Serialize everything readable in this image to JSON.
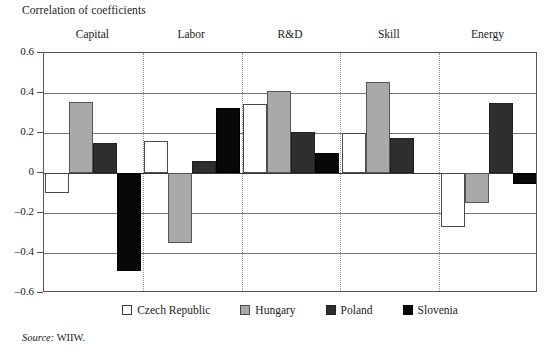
{
  "figure": {
    "title": "Correlation of coefficients",
    "source_prefix": "Source:",
    "source_value": "WIIW."
  },
  "axis": {
    "ytick_labels": [
      "0.6",
      "0.4",
      "0.2",
      "0",
      "–0.2",
      "–0.4",
      "–0.6"
    ]
  },
  "legend": {
    "items": [
      {
        "label": "Czech  Republic",
        "key": "czech",
        "color": "#ffffff"
      },
      {
        "label": "Hungary",
        "key": "hungary",
        "color": "#a9a9a9"
      },
      {
        "label": "Poland",
        "key": "poland",
        "color": "#2e2e2e"
      },
      {
        "label": "Slovenia",
        "key": "slovenia",
        "color": "#080808"
      }
    ]
  },
  "groups": {
    "labels": [
      "Capital",
      "Labor",
      "R&D",
      "Skill",
      "Energy"
    ]
  },
  "chart_data": {
    "type": "bar",
    "title": "Correlation of coefficients",
    "xlabel": "",
    "ylabel": "",
    "ylim": [
      -0.6,
      0.6
    ],
    "ytick_values": [
      0.6,
      0.4,
      0.2,
      0,
      -0.2,
      -0.4,
      -0.6
    ],
    "grid": true,
    "legend_position": "bottom",
    "categories": [
      "Capital",
      "Labor",
      "R&D",
      "Skill",
      "Energy"
    ],
    "series": [
      {
        "name": "Czech  Republic",
        "color": "#ffffff",
        "values": [
          -0.1,
          0.16,
          0.345,
          0.2,
          -0.27
        ]
      },
      {
        "name": "Hungary",
        "color": "#a9a9a9",
        "values": [
          0.355,
          -0.35,
          0.41,
          0.455,
          -0.15
        ]
      },
      {
        "name": "Poland",
        "color": "#2e2e2e",
        "values": [
          0.15,
          0.06,
          0.205,
          0.175,
          0.35
        ]
      },
      {
        "name": "Slovenia",
        "color": "#080808",
        "values": [
          -0.49,
          0.325,
          0.1,
          0.0,
          -0.055
        ]
      }
    ]
  }
}
